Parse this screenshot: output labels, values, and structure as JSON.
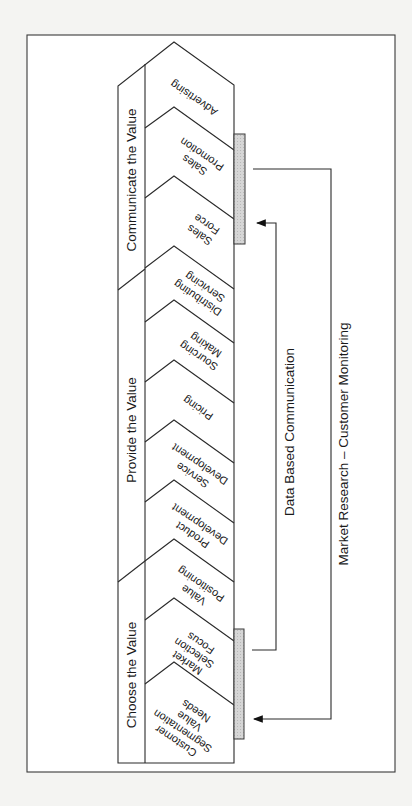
{
  "diagram": {
    "orientation": "rotated-90-clockwise",
    "colors": {
      "background": "#f4f4f2",
      "panel": "#ffffff",
      "line": "#2a2a2a",
      "hatch": "#cfcfcf"
    },
    "sections": [
      {
        "id": "choose",
        "label": "Choose the Value"
      },
      {
        "id": "provide",
        "label": "Provide the Value"
      },
      {
        "id": "communicate",
        "label": "Communicate the Value"
      }
    ],
    "activities": [
      {
        "id": "customer-segmentation",
        "section": "choose",
        "lines": [
          "Customer",
          "Segmentation",
          "Value",
          "Needs"
        ]
      },
      {
        "id": "market-selection",
        "section": "choose",
        "lines": [
          "Market",
          "Selection",
          "Focus"
        ]
      },
      {
        "id": "value-positioning",
        "section": "choose",
        "lines": [
          "Value",
          "Positioning"
        ]
      },
      {
        "id": "product-development",
        "section": "provide",
        "lines": [
          "Product",
          "Development"
        ]
      },
      {
        "id": "service-development",
        "section": "provide",
        "lines": [
          "Service",
          "Development"
        ]
      },
      {
        "id": "pricing",
        "section": "provide",
        "lines": [
          "Pricing"
        ]
      },
      {
        "id": "sourcing-making",
        "section": "provide",
        "lines": [
          "Sourcing",
          "Making"
        ]
      },
      {
        "id": "distributing-servicing",
        "section": "provide",
        "lines": [
          "Distributing",
          "Servicing"
        ]
      },
      {
        "id": "sales-force",
        "section": "communicate",
        "lines": [
          "Sales",
          "Force"
        ]
      },
      {
        "id": "sales-promotion",
        "section": "communicate",
        "lines": [
          "Sales",
          "Promotion"
        ]
      },
      {
        "id": "advertising",
        "section": "communicate",
        "lines": [
          "Advertising"
        ]
      }
    ],
    "feedback_loops": [
      {
        "id": "data-based-communication",
        "label": "Data Based Communication",
        "from": "market-selection",
        "to": "sales-force"
      },
      {
        "id": "market-research",
        "label": "Market Research – Customer Monitoring",
        "from": "sales-promotion",
        "to": "customer-segmentation"
      }
    ]
  }
}
